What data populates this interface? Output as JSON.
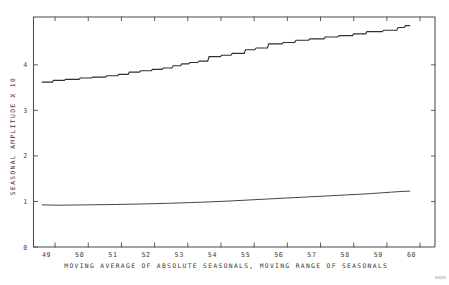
{
  "chart_data": {
    "type": "line",
    "title": "",
    "xlabel": "MOVING AVERAGE OF ABSOLUTE SEASONALS, MOVING RANGE OF SEASONALS",
    "ylabel": "SEASONAL AMPLITUDE X 10",
    "xlim": [
      48.35,
      60.45
    ],
    "ylim": [
      0,
      5.05
    ],
    "xticks": [
      49,
      50,
      51,
      52,
      53,
      54,
      55,
      56,
      57,
      58,
      59,
      60
    ],
    "xtick_labels": [
      "49",
      "50",
      "51",
      "52",
      "53",
      "54",
      "55",
      "56",
      "57",
      "58",
      "59",
      "60"
    ],
    "yticks": [
      0,
      1,
      2,
      3,
      4
    ],
    "ytick_labels": [
      "0",
      "1",
      "2",
      "3",
      "4"
    ],
    "grid": false,
    "legend": "none",
    "series": [
      {
        "name": "moving-range-of-seasonals",
        "style": "staircase",
        "x": [
          48.6,
          48.92,
          48.95,
          49.28,
          49.32,
          49.72,
          49.76,
          50.1,
          50.14,
          50.52,
          50.56,
          50.88,
          50.92,
          51.2,
          51.24,
          51.54,
          51.58,
          51.9,
          51.94,
          52.22,
          52.26,
          52.52,
          52.56,
          52.78,
          52.82,
          53.02,
          53.06,
          53.3,
          53.34,
          53.6,
          53.64,
          53.98,
          54.02,
          54.3,
          54.34,
          54.7,
          54.74,
          55.02,
          55.06,
          55.4,
          55.44,
          55.84,
          55.88,
          56.22,
          56.26,
          56.64,
          56.68,
          57.1,
          57.14,
          57.52,
          57.56,
          57.96,
          58.0,
          58.36,
          58.4,
          58.86,
          58.9,
          59.3,
          59.34,
          59.52,
          59.56,
          59.7
        ],
        "y": [
          3.62,
          3.62,
          3.66,
          3.66,
          3.68,
          3.68,
          3.71,
          3.71,
          3.73,
          3.73,
          3.76,
          3.76,
          3.79,
          3.79,
          3.84,
          3.84,
          3.87,
          3.87,
          3.9,
          3.9,
          3.93,
          3.93,
          3.98,
          3.98,
          4.02,
          4.02,
          4.05,
          4.05,
          4.08,
          4.08,
          4.18,
          4.18,
          4.21,
          4.21,
          4.25,
          4.25,
          4.33,
          4.33,
          4.37,
          4.37,
          4.46,
          4.46,
          4.49,
          4.49,
          4.54,
          4.54,
          4.57,
          4.57,
          4.61,
          4.61,
          4.64,
          4.64,
          4.68,
          4.68,
          4.73,
          4.73,
          4.76,
          4.76,
          4.82,
          4.82,
          4.86,
          4.86
        ]
      },
      {
        "name": "moving-average-of-absolute-seasonals",
        "style": "smooth",
        "x": [
          48.6,
          48.82,
          49.05,
          49.3,
          49.58,
          49.88,
          50.18,
          50.5,
          50.82,
          51.14,
          51.46,
          51.78,
          52.1,
          52.42,
          52.74,
          53.06,
          53.38,
          53.7,
          54.02,
          54.34,
          54.66,
          54.98,
          55.3,
          55.62,
          55.94,
          56.26,
          56.58,
          56.9,
          57.22,
          57.54,
          57.86,
          58.18,
          58.5,
          58.82,
          59.14,
          59.42,
          59.7
        ],
        "y": [
          0.925,
          0.922,
          0.918,
          0.92,
          0.922,
          0.924,
          0.927,
          0.93,
          0.934,
          0.938,
          0.943,
          0.948,
          0.954,
          0.96,
          0.967,
          0.975,
          0.983,
          0.992,
          1.002,
          1.013,
          1.025,
          1.038,
          1.05,
          1.062,
          1.074,
          1.086,
          1.098,
          1.11,
          1.122,
          1.134,
          1.146,
          1.158,
          1.172,
          1.188,
          1.205,
          1.218,
          1.228
        ]
      }
    ]
  },
  "colors": {
    "line": "#2e2e2e",
    "axis": "#4a4a4a",
    "text": "#343434",
    "background": "#ffffff"
  }
}
